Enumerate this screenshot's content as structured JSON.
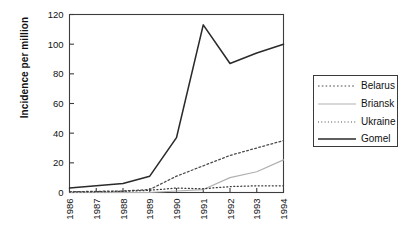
{
  "chart_data": {
    "type": "line",
    "title": "",
    "xlabel": "",
    "ylabel": "Incidence per million",
    "x": [
      "1986",
      "1987",
      "1988",
      "1989",
      "1990",
      "1991",
      "1992",
      "1993",
      "1994"
    ],
    "categories": [
      "1986",
      "1987",
      "1988",
      "1989",
      "1990",
      "1991",
      "1992",
      "1993",
      "1994"
    ],
    "ylim": [
      0,
      120
    ],
    "yticks": [
      0,
      20,
      40,
      60,
      80,
      100,
      120
    ],
    "ytick_labels": [
      "0",
      "20",
      "40",
      "60",
      "80",
      "100",
      "120"
    ],
    "grid": false,
    "legend_position": "right-outside",
    "series": [
      {
        "name": "Belarus",
        "style": "dashed",
        "color": "#4a4a4a",
        "values": [
          0.5,
          0.8,
          1.0,
          2.0,
          11.0,
          18.0,
          25.0,
          30.0,
          35.0
        ]
      },
      {
        "name": "Briansk",
        "style": "solid-light",
        "color": "#b0b0b0",
        "values": [
          0.0,
          0.0,
          0.0,
          0.0,
          1.0,
          2.0,
          10.0,
          14.0,
          22.0
        ]
      },
      {
        "name": "Ukraine",
        "style": "dotted",
        "color": "#3a3a3a",
        "values": [
          0.3,
          0.5,
          0.8,
          1.5,
          3.0,
          2.5,
          4.0,
          4.5,
          4.5
        ]
      },
      {
        "name": "Gomel",
        "style": "solid",
        "color": "#2a2a2a",
        "values": [
          3.0,
          4.5,
          6.0,
          11.0,
          37.0,
          113.0,
          87.0,
          94.0,
          100.0
        ]
      }
    ]
  },
  "legend": {
    "entries": [
      {
        "label": "Belarus"
      },
      {
        "label": "Briansk"
      },
      {
        "label": "Ukraine"
      },
      {
        "label": "Gomel"
      }
    ]
  },
  "axes": {
    "y_title": "Incidence per million"
  }
}
